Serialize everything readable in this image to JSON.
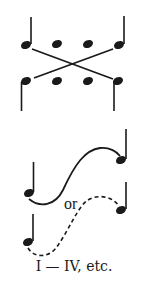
{
  "diagram": {
    "upper_figure": {
      "description": "Crossing voice-leading: two staves of four note heads each, outer notes connected by crossing lines",
      "top_row_notes": 4,
      "bottom_row_notes": 4
    },
    "lower_figure": {
      "connector_label": "or",
      "solid_curve": "ascending S-curve connecting low note to high note",
      "dashed_curve": "ascending dashed S-curve connecting low note to middle note"
    },
    "caption": "I — IV, etc."
  },
  "colors": {
    "ink": "#1a1a1a",
    "background": "#ffffff"
  }
}
